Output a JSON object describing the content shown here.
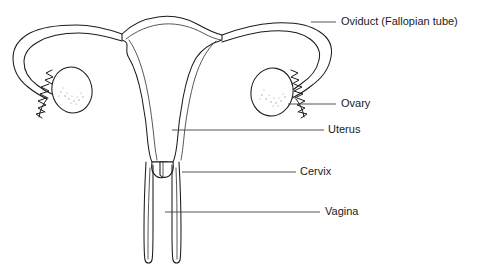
{
  "diagram": {
    "background_color": "#ffffff",
    "line_color": "#1b1b1b",
    "leader_color": "#4a4a4a",
    "stipple_color": "#9a9a9a",
    "style": "black and white anatomical line drawing",
    "orientation": "frontal (coronal) view, bilaterally symmetric"
  },
  "labels": [
    {
      "id": "oviduct",
      "text": "Oviduct (Fallopian tube)",
      "text_x": 341,
      "text_y": 22,
      "leader_x1": 311,
      "leader_y1": 22,
      "leader_x2": 336,
      "leader_y2": 22
    },
    {
      "id": "ovary",
      "text": "Ovary",
      "text_x": 341,
      "text_y": 104,
      "leader_x1": 288,
      "leader_y1": 104,
      "leader_x2": 336,
      "leader_y2": 104
    },
    {
      "id": "uterus",
      "text": "Uterus",
      "text_x": 328,
      "text_y": 130,
      "leader_x1": 172,
      "leader_y1": 130,
      "leader_x2": 324,
      "leader_y2": 130
    },
    {
      "id": "cervix",
      "text": "Cervix",
      "text_x": 300,
      "text_y": 172,
      "leader_x1": 182,
      "leader_y1": 172,
      "leader_x2": 296,
      "leader_y2": 172
    },
    {
      "id": "vagina",
      "text": "Vagina",
      "text_x": 325,
      "text_y": 212,
      "leader_x1": 165,
      "leader_y1": 212,
      "leader_x2": 320,
      "leader_y2": 212
    }
  ],
  "structures": [
    {
      "id": "left-oviduct",
      "name": "left oviduct (fallopian tube)"
    },
    {
      "id": "right-oviduct",
      "name": "right oviduct (fallopian tube)"
    },
    {
      "id": "left-ovary",
      "name": "left ovary",
      "cx": 72,
      "cy": 90,
      "rx": 20,
      "ry": 23
    },
    {
      "id": "right-ovary",
      "name": "right ovary",
      "cx": 272,
      "cy": 92,
      "rx": 21,
      "ry": 24
    },
    {
      "id": "left-fimbriae",
      "name": "left fimbriae"
    },
    {
      "id": "right-fimbriae",
      "name": "right fimbriae"
    },
    {
      "id": "uterus-body",
      "name": "uterus body with endometrial lining"
    },
    {
      "id": "cervix-body",
      "name": "cervix"
    },
    {
      "id": "vagina-canal",
      "name": "vaginal canal"
    }
  ]
}
